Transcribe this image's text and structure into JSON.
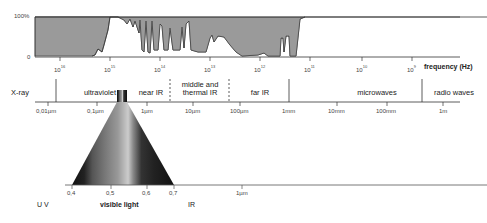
{
  "transmission_chart": {
    "y_labels": {
      "top": "100%",
      "bottom": "0"
    },
    "x_axis_title": "frequency (Hz)",
    "frequency_ticks": [
      {
        "base": "10",
        "exp": "16",
        "x": 60
      },
      {
        "base": "10",
        "exp": "15",
        "x": 110
      },
      {
        "base": "10",
        "exp": "14",
        "x": 160
      },
      {
        "base": "10",
        "exp": "13",
        "x": 210
      },
      {
        "base": "10",
        "exp": "12",
        "x": 260
      },
      {
        "base": "10",
        "exp": "11",
        "x": 310
      },
      {
        "base": "10",
        "exp": "10",
        "x": 362
      },
      {
        "base": "10",
        "exp": "9",
        "x": 412
      }
    ],
    "fill_color": "#9a9a9a"
  },
  "bands": [
    {
      "label": "X-ray",
      "x": 18
    },
    {
      "label": "ultraviolet",
      "x": 100
    },
    {
      "label": "near IR",
      "x": 146
    },
    {
      "label": "middle and\nthermal IR",
      "x": 200
    },
    {
      "label": "far IR",
      "x": 260
    },
    {
      "label": "microwaves",
      "x": 377
    },
    {
      "label": "radio waves",
      "x": 460
    }
  ],
  "wavelength_ticks": [
    {
      "label": "0,01µm",
      "x": 48
    },
    {
      "label": "0,1µm",
      "x": 97
    },
    {
      "label": "1µm",
      "x": 147
    },
    {
      "label": "10µm",
      "x": 193
    },
    {
      "label": "100µm",
      "x": 240
    },
    {
      "label": "1mm",
      "x": 289
    },
    {
      "label": "10mm",
      "x": 337
    },
    {
      "label": "100mm",
      "x": 387
    },
    {
      "label": "1m",
      "x": 443
    }
  ],
  "visible_scale": {
    "ticks": [
      {
        "label": "0,4",
        "x": 72
      },
      {
        "label": "0,5",
        "x": 111
      },
      {
        "label": "0,6",
        "x": 147
      },
      {
        "label": "0,7",
        "x": 174
      },
      {
        "label": "1µm",
        "x": 242
      }
    ],
    "region_labels": [
      {
        "label": "U V",
        "x": 42
      },
      {
        "label": "visible light",
        "x": 118
      },
      {
        "label": "IR",
        "x": 193
      }
    ]
  }
}
